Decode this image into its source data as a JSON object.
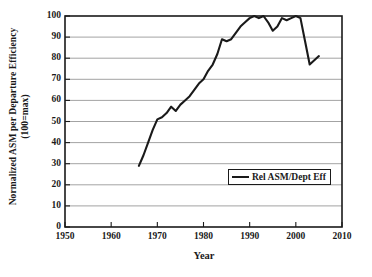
{
  "chart_data": {
    "type": "line",
    "title": "",
    "xlabel": "Year",
    "ylabel_line1": "Normalized ASM per Departure Efficiency",
    "ylabel_line2": "(100=max)",
    "xlim": [
      1950,
      2010
    ],
    "ylim": [
      0,
      100
    ],
    "xticks": [
      1950,
      1960,
      1970,
      1980,
      1990,
      2000,
      2010
    ],
    "yticks": [
      0,
      10,
      20,
      30,
      40,
      50,
      60,
      70,
      80,
      90,
      100
    ],
    "grid": "horizontal",
    "legend_position": "center-right-inside",
    "series": [
      {
        "name": "Rel ASM/Dept Eff",
        "color": "#1a1a1a",
        "x": [
          1966,
          1967,
          1968,
          1969,
          1970,
          1971,
          1972,
          1973,
          1974,
          1975,
          1976,
          1977,
          1978,
          1979,
          1980,
          1981,
          1982,
          1983,
          1984,
          1985,
          1986,
          1987,
          1988,
          1989,
          1990,
          1991,
          1992,
          1993,
          1994,
          1995,
          1996,
          1997,
          1998,
          1999,
          2000,
          2001,
          2002,
          2003,
          2004,
          2005
        ],
        "values": [
          29,
          34,
          40,
          46,
          51,
          52,
          54,
          57,
          55,
          58,
          60,
          62,
          65,
          68,
          70,
          74,
          77,
          82,
          89,
          88,
          89,
          92,
          95,
          97,
          99,
          100,
          99,
          100,
          97,
          93,
          95,
          99,
          98,
          99,
          100,
          99,
          88,
          77,
          79,
          81
        ]
      }
    ]
  },
  "legend": {
    "entries": [
      {
        "label": "Rel ASM/Dept Eff"
      }
    ]
  }
}
